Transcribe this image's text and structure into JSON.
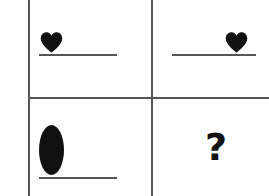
{
  "puzzle": {
    "type": "visual-analogy-matrix",
    "rows": 2,
    "columns": 2,
    "grid_color": "#555555",
    "ink_color": "#111111",
    "background_color": "#ffffff",
    "cells": [
      {
        "position": "top-left",
        "shape": "heart",
        "shape_alignment": "left",
        "has_baseline": true
      },
      {
        "position": "top-right",
        "shape": "heart",
        "shape_alignment": "right",
        "has_baseline": true
      },
      {
        "position": "bottom-left",
        "shape": "ellipse",
        "shape_alignment": "left",
        "has_baseline": true
      },
      {
        "position": "bottom-right",
        "shape": "question-mark",
        "label": "?",
        "shape_alignment": "center",
        "has_baseline": false
      }
    ]
  }
}
